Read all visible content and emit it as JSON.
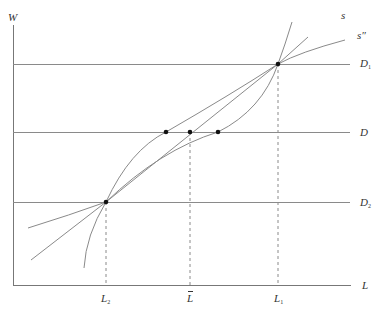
{
  "diagram": {
    "colors": {
      "line": "#8a8a8a",
      "axis": "#777777",
      "point": "#111111",
      "text": "#333333"
    },
    "axes": {
      "y_label": "W",
      "x_label": "L"
    },
    "horizontal_lines": [
      {
        "name": "D1",
        "label": "D",
        "subscript": "1"
      },
      {
        "name": "D",
        "label": "D",
        "subscript": ""
      },
      {
        "name": "D2",
        "label": "D",
        "subscript": "2"
      }
    ],
    "curves": [
      {
        "name": "s",
        "label": "s"
      },
      {
        "name": "s-double-prime",
        "label": "s″"
      },
      {
        "name": "concave-curve",
        "label": ""
      }
    ],
    "x_ticks": [
      {
        "name": "L2",
        "label": "L",
        "subscript": "2"
      },
      {
        "name": "L-bar",
        "label": "L",
        "subscript": "",
        "overbar": true
      },
      {
        "name": "L1",
        "label": "L",
        "subscript": "1"
      }
    ],
    "points": [
      {
        "name": "intersection-L2-D2"
      },
      {
        "name": "intersection-L1-D1"
      },
      {
        "name": "point-on-D-left"
      },
      {
        "name": "point-on-D-center"
      },
      {
        "name": "point-on-D-right"
      }
    ]
  }
}
